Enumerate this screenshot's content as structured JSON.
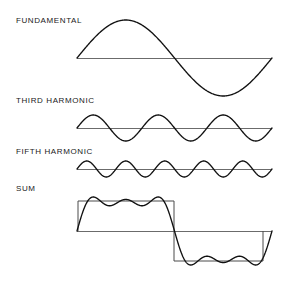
{
  "figure": {
    "background_color": "#ffffff",
    "width": 291,
    "height": 288
  },
  "labels": {
    "fundamental": "FUNDAMENTAL",
    "third_harmonic": "THIRD HARMONIC",
    "fifth_harmonic": "FIFTH HARMONIC",
    "sum": "SUM"
  },
  "colors": {
    "curve": "#111111",
    "axis": "#6b6b6b",
    "square": "#4a4a4a",
    "text": "#1a1a1a"
  },
  "chart_data": {
    "type": "line",
    "xlabel": "",
    "ylabel": "",
    "grid": false,
    "legend_position": "left-inline-labels",
    "x_domain": [
      0,
      1
    ],
    "x_description": "one full period of the fundamental",
    "panels": [
      {
        "name": "fundamental",
        "label": "FUNDAMENTAL",
        "harmonic": 1,
        "cycles_per_period": 1,
        "relative_amplitude": 1.0,
        "baseline_y_px": 58,
        "amplitude_px": 38,
        "x_start_px": 77,
        "x_end_px": 272,
        "formula": "sin(2*pi*x)"
      },
      {
        "name": "third_harmonic",
        "label": "THIRD HARMONIC",
        "harmonic": 3,
        "cycles_per_period": 3,
        "relative_amplitude": 0.3333,
        "baseline_y_px": 128,
        "amplitude_px": 13,
        "x_start_px": 77,
        "x_end_px": 272,
        "formula": "(1/3)*sin(6*pi*x)"
      },
      {
        "name": "fifth_harmonic",
        "label": "FIFTH HARMONIC",
        "harmonic": 5,
        "cycles_per_period": 5,
        "relative_amplitude": 0.2,
        "baseline_y_px": 169,
        "amplitude_px": 8,
        "x_start_px": 77,
        "x_end_px": 272,
        "formula": "(1/5)*sin(10*pi*x)"
      },
      {
        "name": "sum",
        "label": "SUM",
        "harmonic": "1+3+5",
        "cycles_per_period": 1,
        "relative_amplitude": 1.0,
        "baseline_y_px": 231,
        "amplitude_px": 34,
        "x_start_px": 77,
        "x_end_px": 272,
        "formula": "sin(2*pi*x) + (1/3)*sin(6*pi*x) + (1/5)*sin(10*pi*x)",
        "reference_square_wave": {
          "shown": true,
          "amplitude_px": 30,
          "left_px": 78,
          "mid_px": 174,
          "right_px": 263,
          "top_y_px": 201,
          "bottom_y_px": 261
        }
      }
    ]
  }
}
